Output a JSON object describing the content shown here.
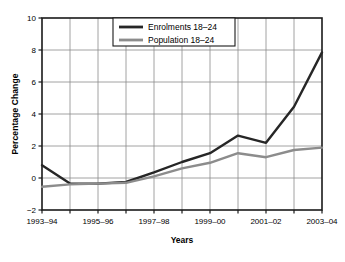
{
  "chart_data": {
    "type": "line",
    "title": "",
    "xlabel": "Years",
    "ylabel": "Percentage Change",
    "ylim": [
      -2,
      10
    ],
    "yticks": [
      -2,
      0,
      2,
      4,
      6,
      8,
      10
    ],
    "ytick_labels": [
      "−2",
      "0",
      "2",
      "4",
      "6",
      "8",
      "10"
    ],
    "grid": true,
    "legend_position": "top-center",
    "x": [
      "1993–94",
      "1994–95",
      "1995–96",
      "1996–97",
      "1997–98",
      "1998–99",
      "1999–00",
      "2000–01",
      "2001–02",
      "2002–03",
      "2003–04"
    ],
    "xtick_labels_shown": [
      "1993–94",
      "1995–96",
      "1997–98",
      "1999–00",
      "2001–02",
      "2003–04"
    ],
    "series": [
      {
        "name": "Enrolments 18–24",
        "color": "#262626",
        "values": [
          0.8,
          -0.35,
          -0.35,
          -0.25,
          0.35,
          1.0,
          1.55,
          2.65,
          2.2,
          4.45,
          7.85
        ]
      },
      {
        "name": "Population 18–24",
        "color": "#8c8c8c",
        "values": [
          -0.55,
          -0.4,
          -0.35,
          -0.3,
          0.1,
          0.6,
          0.95,
          1.55,
          1.3,
          1.75,
          1.9
        ]
      }
    ],
    "series_extra_note": ""
  },
  "legend": {
    "items": [
      {
        "label": "Enrolments 18–24",
        "color": "#262626"
      },
      {
        "label": "Population 18–24",
        "color": "#8c8c8c"
      }
    ]
  },
  "axes": {
    "y_title": "Percentage Change",
    "x_title": "Years"
  },
  "colors": {
    "enrolments": "#262626",
    "population": "#8c8c8c",
    "grid": "#8a8a8a",
    "frame": "#1a1a1a",
    "background": "#ffffff"
  }
}
